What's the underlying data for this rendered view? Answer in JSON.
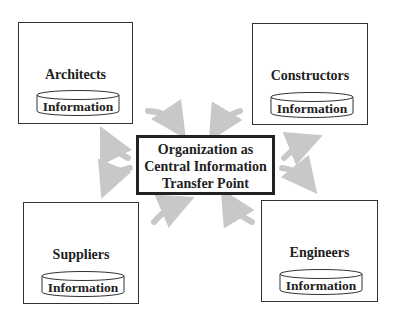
{
  "diagram": {
    "center": {
      "lines": [
        "Organization as",
        "Central Information",
        "Transfer Point"
      ]
    },
    "nodes": [
      {
        "id": "architects",
        "label": "Architects",
        "store_label": "Information"
      },
      {
        "id": "constructors",
        "label": "Constructors",
        "store_label": "Information"
      },
      {
        "id": "suppliers",
        "label": "Suppliers",
        "store_label": "Information"
      },
      {
        "id": "engineers",
        "label": "Engineers",
        "store_label": "Information"
      }
    ],
    "arrow_color": "#c8c8c8",
    "border_color": "#333333"
  }
}
